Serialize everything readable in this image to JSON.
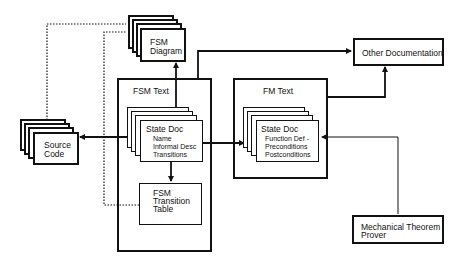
{
  "nodes": {
    "fsm_diagram": {
      "line1": "FSM",
      "line2": "Diagram"
    },
    "fsm_text": {
      "title": "FSM Text"
    },
    "fsm_state_doc": {
      "title": "State Doc",
      "items": [
        "Name",
        "Informal Desc",
        "Transitions"
      ]
    },
    "fsm_transition_table": {
      "line1": "FSM",
      "line2": "Transition",
      "line3": "Table"
    },
    "fm_text": {
      "title": "FM Text"
    },
    "fm_state_doc": {
      "title": "State Doc",
      "items": [
        "Function Def -",
        "Preconditions",
        "Postconditions"
      ]
    },
    "other_documentation": {
      "label": "Other Documentation"
    },
    "source_code": {
      "line1": "Source",
      "line2": "Code"
    },
    "theorem_prover": {
      "line1": "Mechanical Theorem",
      "line2": "Prover"
    }
  },
  "edges": [
    {
      "from": "fsm_state_doc",
      "to": "fsm_diagram",
      "style": "solid"
    },
    {
      "from": "fsm_text",
      "to": "other_documentation",
      "style": "solid"
    },
    {
      "from": "fsm_state_doc",
      "to": "source_code",
      "style": "solid"
    },
    {
      "from": "fsm_state_doc",
      "to": "fm_state_doc",
      "style": "solid"
    },
    {
      "from": "fsm_state_doc",
      "to": "fsm_transition_table",
      "style": "solid"
    },
    {
      "from": "fm_text",
      "to": "other_documentation",
      "style": "solid"
    },
    {
      "from": "theorem_prover",
      "to": "fm_state_doc",
      "style": "solid-thin"
    },
    {
      "from": "source_code",
      "to": "fsm_diagram",
      "style": "dotted"
    },
    {
      "from": "fsm_transition_table",
      "to": "fsm_diagram",
      "style": "dotted"
    }
  ],
  "colors": {
    "line": "#111111",
    "background": "#ffffff"
  }
}
